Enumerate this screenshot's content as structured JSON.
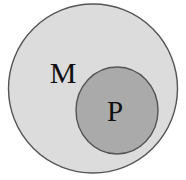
{
  "figure": {
    "type": "euler-diagram",
    "title": "",
    "background_color": "#ffffff",
    "canvas": {
      "width": 186,
      "height": 180
    }
  },
  "sets": [
    {
      "key": "outer",
      "name": "set-m",
      "label": "M",
      "role": "superset",
      "fill_color": "#dcdcdc",
      "stroke_color": "#555555",
      "stroke_width": 1.4,
      "shape": "circle",
      "center_x": 93,
      "center_y": 88.5,
      "radius": 84.5,
      "label_x": 63,
      "label_y": 83,
      "label_font_size": 30,
      "label_color": "#111111"
    },
    {
      "key": "inner",
      "name": "set-p",
      "label": "P",
      "role": "subset",
      "fill_color": "#aaaaaa",
      "stroke_color": "#555555",
      "stroke_width": 1.4,
      "shape": "ellipse",
      "center_x": 117,
      "center_y": 110.5,
      "radius_x": 41,
      "radius_y": 43.5,
      "label_x": 115,
      "label_y": 121,
      "label_font_size": 29,
      "label_color": "#111111"
    }
  ],
  "relationship": {
    "description": "P is entirely contained within M",
    "notation": "P ⊂ M"
  }
}
